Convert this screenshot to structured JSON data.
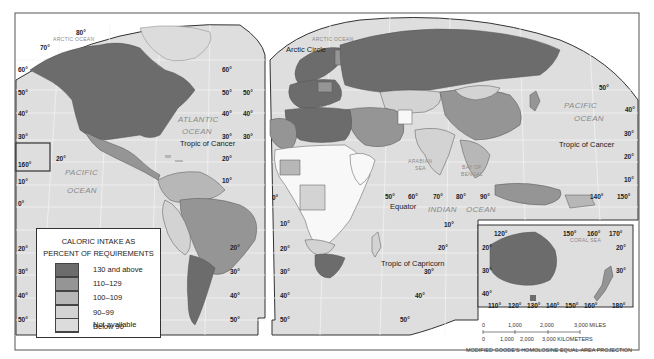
{
  "map": {
    "type": "choropleth",
    "projection": "MODIFIED GOODE'S HOMOLOSINE EQUAL-AREA PROJECTION",
    "colors": {
      "background": "#ffffff",
      "ocean": "#e0e0e0",
      "graticule": "#f4f4f4",
      "border": "#444444"
    },
    "legend": {
      "title_line1": "CALORIC INTAKE AS",
      "title_line2": "PERCENT OF REQUIREMENTS",
      "items": [
        {
          "label": "130 and above",
          "color": "#6c6c6c"
        },
        {
          "label": "110–129",
          "color": "#959595"
        },
        {
          "label": "100–109",
          "color": "#b7b7b7"
        },
        {
          "label": "90–99",
          "color": "#d3d3d3"
        },
        {
          "label": "Below 90",
          "color": "#f8f8f8"
        },
        {
          "label": "Not available",
          "color": "#dcdcdc"
        }
      ]
    },
    "oceans": {
      "arctic_left": "ARCTIC OCEAN",
      "arctic_right": "ARCTIC OCEAN",
      "atlantic_1": "ATLANTIC",
      "atlantic_2": "OCEAN",
      "pacific_left_1": "PACIFIC",
      "pacific_left_2": "OCEAN",
      "pacific_right_1": "PACIFIC",
      "pacific_right_2": "OCEAN",
      "indian_1": "INDIAN",
      "indian_2": "OCEAN",
      "arabian_1": "ARABIAN",
      "arabian_2": "SEA",
      "bengal_1": "BAY OF",
      "bengal_2": "BENGAL",
      "coral": "CORAL   SEA"
    },
    "lines": {
      "arctic_circle": "Arctic Circle",
      "tropic_cancer_left": "Tropic of Cancer",
      "tropic_cancer_right": "Tropic of Cancer",
      "equator": "Equator",
      "tropic_capricorn": "Tropic of Capricorn"
    },
    "degrees": {
      "d80": "80°",
      "d70": "70°",
      "d60": "60°",
      "d50": "50°",
      "d40": "40°",
      "d30": "30°",
      "d20": "20°",
      "d10": "10°",
      "d0": "0°",
      "d90": "90°",
      "d110": "110°",
      "d120": "120°",
      "d130": "130°",
      "d140": "140°",
      "d150": "150°",
      "d160": "160°",
      "d170": "170°",
      "d180": "180°"
    },
    "scale": {
      "miles_ticks": [
        "0",
        "1,000",
        "2,000",
        "3,000 MILES"
      ],
      "km_ticks": [
        "0",
        "1,000",
        "2,000",
        "3,000 KILOMETERS"
      ]
    }
  }
}
